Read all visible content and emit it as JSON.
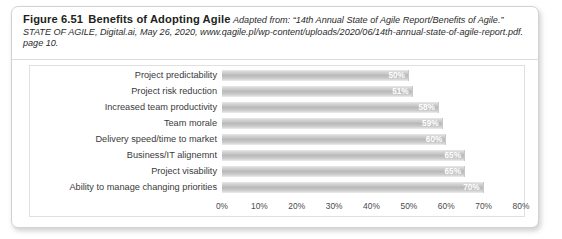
{
  "figure": {
    "number": "Figure 6.51",
    "title": "Benefits of Adopting Agile",
    "source": "Adapted from: “14th Annual State of Agile Report/Benefits of Agile.” STATE OF AGILE, Digital.ai, May 26, 2020, www.qagile.pl/wp-content/uploads/2020/06/14th-annual-state-of-agile-report.pdf. page 10."
  },
  "chart_data": {
    "type": "bar",
    "orientation": "horizontal",
    "title": "Benefits of Adopting Agile",
    "xlabel": "",
    "ylabel": "",
    "categories": [
      "Project predictability",
      "Project risk reduction",
      "Increased team productivity",
      "Team morale",
      "Delivery speed/time to market",
      "Business/IT alignemnt",
      "Project visability",
      "Ability to manage changing priorities"
    ],
    "values": [
      50,
      51,
      58,
      59,
      60,
      65,
      65,
      70
    ],
    "value_labels": [
      "50%",
      "51%",
      "58%",
      "59%",
      "60%",
      "65%",
      "65%",
      "70%"
    ],
    "xlim": [
      0,
      80
    ],
    "xticks": [
      0,
      10,
      20,
      30,
      40,
      50,
      60,
      70,
      80
    ],
    "xtick_labels": [
      "0%",
      "10%",
      "20%",
      "30%",
      "40%",
      "50%",
      "60%",
      "70%",
      "80%"
    ],
    "grid": false,
    "legend": null,
    "bar_color": "#b9b9b9",
    "value_label_color": "#ffffff"
  }
}
